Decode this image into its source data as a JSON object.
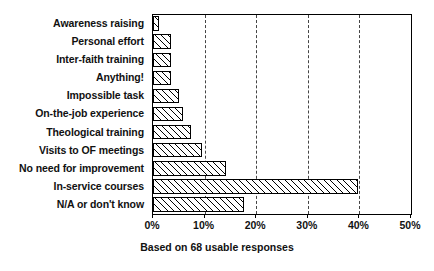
{
  "chart_data": {
    "type": "bar",
    "orientation": "horizontal",
    "title": "",
    "subtitle": "",
    "caption": "Based on 68 usable responses",
    "xlabel": "",
    "ylabel": "",
    "xlim": [
      0,
      50
    ],
    "grid": true,
    "grid_axis": "x",
    "grid_style": "dashed",
    "legend": false,
    "categories": [
      "Awareness raising",
      "Personal effort",
      "Inter-faith training",
      "Anything!",
      "Impossible task",
      "On-the-job experience",
      "Theological training",
      "Visits to OF meetings",
      "No need for improvement",
      "In-service courses",
      "N/A or don't know"
    ],
    "values": [
      1.2,
      3.5,
      3.5,
      3.5,
      5.0,
      5.9,
      7.3,
      9.5,
      14.1,
      39.8,
      17.6
    ],
    "value_unit": "%",
    "xticks": [
      0,
      10,
      20,
      30,
      40,
      50
    ],
    "xtick_labels": [
      "0%",
      "10%",
      "20%",
      "30%",
      "40%",
      "50%"
    ],
    "gridline_values": [
      10,
      20,
      30,
      40
    ],
    "bar_fill": "diagonal-hatch",
    "bar_edge_color": "#000000",
    "bar_face_color": "#ffffff",
    "background_color": "#ffffff"
  }
}
